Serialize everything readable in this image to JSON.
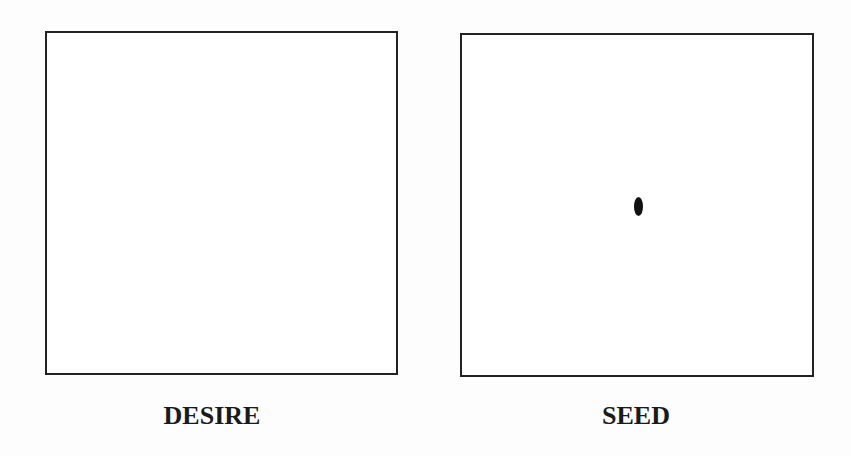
{
  "panels": [
    {
      "label": "DESIRE",
      "content": "empty"
    },
    {
      "label": "SEED",
      "content": "single dot at center"
    }
  ]
}
